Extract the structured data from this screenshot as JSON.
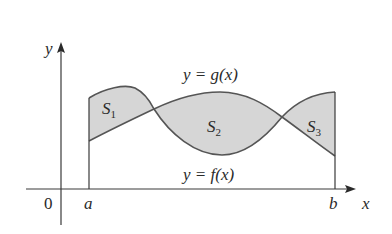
{
  "diagram": {
    "axes": {
      "x_label": "x",
      "y_label": "y",
      "origin_label": "0"
    },
    "bounds": {
      "left_label": "a",
      "right_label": "b"
    },
    "curves": {
      "upper_label": "y = g(x)",
      "lower_label": "y = f(x)"
    },
    "regions": [
      {
        "name": "S",
        "sub": "1"
      },
      {
        "name": "S",
        "sub": "2"
      },
      {
        "name": "S",
        "sub": "3"
      }
    ],
    "colors": {
      "region_fill": "#d6d6d6",
      "curve_stroke": "#555555",
      "axis_stroke": "#3a3a3a"
    }
  }
}
